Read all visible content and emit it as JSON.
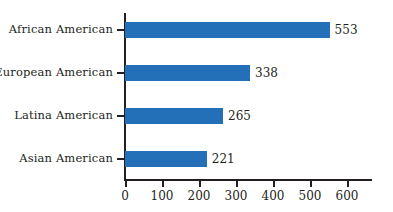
{
  "chart_data": {
    "type": "bar",
    "orientation": "horizontal",
    "title": "",
    "subtitle": "",
    "xlabel": "",
    "ylabel": "",
    "categories": [
      "African American",
      "European American",
      "Latina American",
      "Asian American"
    ],
    "values": [
      553,
      338,
      265,
      221
    ],
    "value_labels": [
      "553",
      "338",
      "265",
      "221"
    ],
    "xlim": [
      0,
      670
    ],
    "xticks": [
      0,
      100,
      200,
      300,
      400,
      500,
      600
    ],
    "xtick_labels": [
      "0",
      "100",
      "200",
      "300",
      "400",
      "500",
      "600"
    ],
    "grid": false,
    "legend": null,
    "bar_color": "#2470b8",
    "axis_color": "#231f20",
    "text_color": "#231f20",
    "background": "#ffffff"
  }
}
